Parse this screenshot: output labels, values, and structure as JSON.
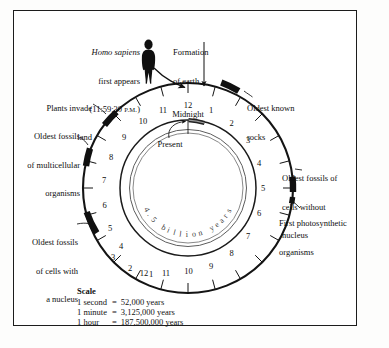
{
  "figure": {
    "title_hidden": "Geologic time as a 24-hour clock",
    "center": {
      "duration_label": "4.5 billion years",
      "present_label": "Present"
    },
    "clock": {
      "midnight_label": "Midnight",
      "outer_numbers_right": [
        "12",
        "1",
        "2",
        "3",
        "4",
        "5",
        "6",
        "7",
        "8",
        "9",
        "10",
        "11",
        "12"
      ],
      "outer_numbers_left": [
        "11",
        "10",
        "9",
        "8",
        "7",
        "6",
        "5",
        "4",
        "3",
        "2",
        "1"
      ]
    },
    "annotations": [
      {
        "name": "homo-sapiens",
        "lines": [
          "Homo sapiens",
          "first appears",
          "(11:59:30 P.M.)"
        ],
        "line1_italic": "Homo sapiens",
        "line2": "first appears",
        "line3_prefix": "(11:59:30 ",
        "line3_smallcaps": "P.M.",
        "line3_suffix": ")"
      },
      {
        "name": "formation-of-earth",
        "lines": [
          "Formation",
          "of earth"
        ],
        "line1": "Formation",
        "line2": "of earth"
      },
      {
        "name": "oldest-known-rocks",
        "line1": "Oldest known",
        "line2": "rocks"
      },
      {
        "name": "oldest-fossils-cells-without-nucleus",
        "line1": "Oldest fossils of",
        "line2": "cells without",
        "line3": "nucleus"
      },
      {
        "name": "first-photosynthetic-organisms",
        "line1": "First photosynthetic",
        "line2": "organisms"
      },
      {
        "name": "oldest-fossils-cells-with-nucleus",
        "line1": "Oldest fossils",
        "line2": "of cells with",
        "line3": "a nucleus"
      },
      {
        "name": "oldest-fossils-multicellular-organisms",
        "line1": "Oldest fossils",
        "line2": "of multicellular",
        "line3": "organisms"
      },
      {
        "name": "plants-invade-land",
        "line1": "Plants invade",
        "line2": "land"
      }
    ],
    "scale": {
      "heading": "Scale",
      "rows": [
        {
          "unit": "1 second",
          "eq": "=",
          "value": "52,000 years"
        },
        {
          "unit": "1 minute",
          "eq": "=",
          "value": "3,125,000 years"
        },
        {
          "unit": "1 hour",
          "eq": "=",
          "value": "187,500,000 years"
        }
      ]
    },
    "colors": {
      "ink": "#0d0d0d",
      "ring": "#1a1a1a",
      "marker": "#111111",
      "paper": "#ffffff",
      "frame": "#1c1c1c"
    }
  },
  "chart_data": {
    "type": "pie",
    "subtitle": "4.5 billion years",
    "xlabel": "",
    "ylabel": "",
    "units": "hours on a 24-hour clock face",
    "total_span_years": 4500000000,
    "legend_position": "bottom-left",
    "grid": false,
    "categories": [
      "Formation of earth",
      "Oldest known rocks",
      "Oldest fossils of cells without nucleus",
      "First photosynthetic organisms",
      "Oldest fossils of cells with a nucleus",
      "Oldest fossils of multicellular organisms",
      "Plants invade land",
      "Homo sapiens first appears"
    ],
    "clock_positions_hours": [
      0,
      2.6,
      16.7,
      18.0,
      3.8,
      20.6,
      21.6,
      23.9917
    ],
    "event_times": [
      "12:00 midnight",
      "2:35 A.M.",
      "4:45 A.M. (second pass)",
      "6:00 A.M. (second pass)",
      "8:55 P.M.",
      "9:35 P.M.",
      "10:35 P.M.",
      "11:59:30 P.M."
    ],
    "scale_conversions": [
      {
        "clock_unit": "1 second",
        "years": 52000
      },
      {
        "clock_unit": "1 minute",
        "years": 3125000
      },
      {
        "clock_unit": "1 hour",
        "years": 187500000
      }
    ],
    "tick_labels_right_side": [
      "12",
      "1",
      "2",
      "3",
      "4",
      "5",
      "6",
      "7",
      "8",
      "9",
      "10",
      "11",
      "12"
    ],
    "tick_labels_left_side": [
      "11",
      "10",
      "9",
      "8",
      "7",
      "6",
      "5",
      "4",
      "3",
      "2",
      "1"
    ],
    "annotations": [
      "Midnight",
      "Present",
      "4.5 billion years"
    ]
  }
}
